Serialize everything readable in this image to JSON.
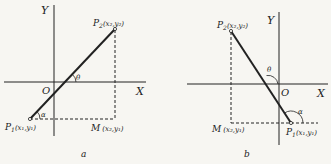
{
  "figure_a": {
    "caption": "a",
    "axis_x_label": "X",
    "axis_y_label": "Y",
    "origin_label": "O",
    "p1": {
      "name": "P",
      "sub": "1",
      "coords": "(x₁,y₁)"
    },
    "p2": {
      "name": "P",
      "sub": "2",
      "coords": "(x₂,y₂)"
    },
    "m": {
      "name": "M",
      "coords": "(x₂,y₁)"
    },
    "angle_theta": "θ",
    "angle_alpha": "α"
  },
  "figure_b": {
    "caption": "b",
    "axis_x_label": "X",
    "axis_y_label": "Y",
    "origin_label": "O",
    "p1": {
      "name": "P",
      "sub": "1",
      "coords": "(x₁,y₁)"
    },
    "p2": {
      "name": "P",
      "sub": "2",
      "coords": "(x₂,y₂)"
    },
    "m": {
      "name": "M",
      "coords": "(x₂,y₁)"
    },
    "angle_theta": "θ",
    "angle_alpha": "α"
  },
  "colors": {
    "ink": "#222222",
    "paper": "#f7f6f2"
  }
}
